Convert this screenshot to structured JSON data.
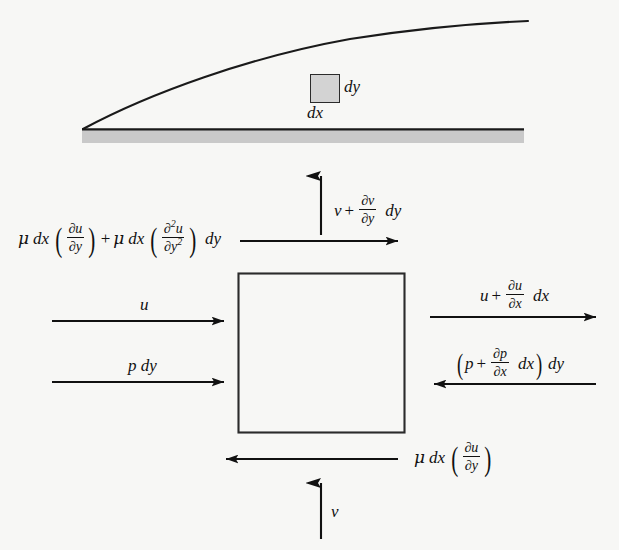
{
  "figure": {
    "background_color": "#f7f7f5",
    "ink_color": "#111111",
    "plate_fill_color": "#c9c9c9",
    "element_fill_color": "#d3d3d3"
  },
  "element": {
    "dy_label": "dy",
    "dx_label": "dx"
  },
  "top_shear": {
    "mu": "μ",
    "dx": "dx",
    "partial": "∂",
    "u": "u",
    "y": "y",
    "plus": "+",
    "dy": "dy",
    "exponent": "2",
    "full_text": "μ dx (∂u/∂y) + μ dx (∂²u/∂y²) dy"
  },
  "top_vertical": {
    "v": "v",
    "plus": "+",
    "partial": "∂",
    "dy": "dy",
    "y": "y",
    "full_text": "v + ∂v/∂y dy"
  },
  "left_momentum": {
    "label": "u"
  },
  "left_pressure": {
    "label": "p dy"
  },
  "right_momentum": {
    "u": "u",
    "plus": "+",
    "partial": "∂",
    "x": "x",
    "dx": "dx",
    "full_text": "u + ∂u/∂x dx"
  },
  "right_pressure": {
    "p": "p",
    "plus": "+",
    "partial": "∂",
    "x": "x",
    "dx": "dx",
    "dy": "dy",
    "full_text": "(p + ∂p/∂x dx) dy"
  },
  "bottom_shear": {
    "mu": "μ",
    "dx": "dx",
    "partial": "∂",
    "u": "u",
    "y": "y",
    "full_text": "μ dx (∂u/∂y)"
  },
  "bottom_vertical": {
    "label": "v"
  }
}
